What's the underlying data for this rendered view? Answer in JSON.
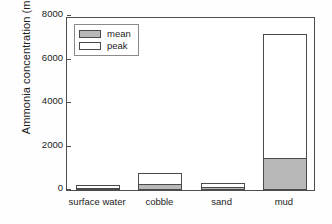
{
  "chart_data": {
    "type": "bar",
    "title": "",
    "subtitle": "",
    "xlabel": "",
    "ylabel": "Ammonia concentration (mg N/L)",
    "categories": [
      "surface water",
      "cobble",
      "sand",
      "mud"
    ],
    "series": [
      {
        "name": "mean",
        "values": [
          50,
          275,
          130,
          1480
        ],
        "color": "#b8b8b8"
      },
      {
        "name": "peak",
        "values": [
          230,
          780,
          300,
          7180
        ],
        "color": "#ffffff"
      }
    ],
    "legend": {
      "position": "top-left-inside",
      "entries": [
        {
          "label": "mean",
          "color": "#b8b8b8"
        },
        {
          "label": "peak",
          "color": "#ffffff"
        }
      ]
    },
    "ylim": [
      0,
      8000
    ],
    "yticks": [
      0,
      2000,
      4000,
      6000,
      8000
    ],
    "ytick_labels": [
      "0",
      "2000",
      "4000",
      "6000",
      "8000"
    ],
    "grid": false,
    "bar_style": "overlaid-stacked: peak outline drawn full height, mean filled from baseline",
    "annotations": []
  }
}
